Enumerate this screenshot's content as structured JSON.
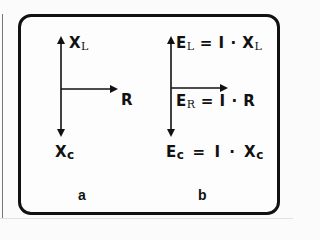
{
  "diagram": {
    "panels": [
      {
        "label": "a",
        "up_vector": {
          "main": "X",
          "sub": "L"
        },
        "right_vector": {
          "main": "R"
        },
        "down_vector": {
          "main": "X",
          "sub": "c"
        }
      },
      {
        "label": "b",
        "up_vector": {
          "main": "E",
          "sub": "L",
          "rest": "= I · X",
          "rest_sub": "L"
        },
        "right_vector": {
          "main": "E",
          "sub": "R",
          "rest": "= I · R"
        },
        "down_vector": {
          "main": "E",
          "sub": "c",
          "rest": "= I · X",
          "rest_sub": "c"
        }
      }
    ],
    "colors": {
      "ink": "#111111",
      "background": "#fbfbfb"
    }
  }
}
